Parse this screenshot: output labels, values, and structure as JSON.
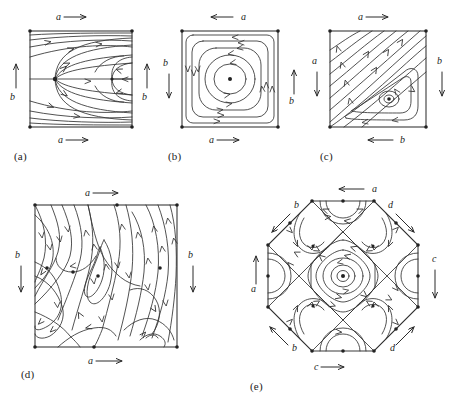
{
  "figure": {
    "background_color": "#ffffff",
    "stroke_color": "#2b2b2b",
    "panel_count": 5
  },
  "panels": [
    {
      "id": "a",
      "caption": "(a)",
      "shape": "square",
      "description": "Saddle-node on left edge midpoint with streamlines sweeping right to a saddle near the right edge",
      "edge_labels": [
        {
          "name": "a",
          "side": "top",
          "direction": "right",
          "glyph": "a"
        },
        {
          "name": "a",
          "side": "bottom",
          "direction": "right",
          "glyph": "a"
        },
        {
          "name": "b",
          "side": "left",
          "direction": "up",
          "glyph": "b"
        },
        {
          "name": "b",
          "side": "right",
          "direction": "up",
          "glyph": "b"
        }
      ],
      "singular_points": [
        "saddle-left-center",
        "saddle-right-center"
      ],
      "vertex_dots": 4
    },
    {
      "id": "b",
      "caption": "(b)",
      "shape": "square",
      "description": "Concentric closed orbits around a single center; nested rounded squares becoming circles",
      "edge_labels": [
        {
          "name": "a",
          "side": "top",
          "direction": "left",
          "glyph": "a"
        },
        {
          "name": "a",
          "side": "bottom",
          "direction": "right",
          "glyph": "a"
        },
        {
          "name": "b",
          "side": "left",
          "direction": "down",
          "glyph": "b"
        },
        {
          "name": "b",
          "side": "right",
          "direction": "up",
          "glyph": "b"
        }
      ],
      "singular_points": [
        "center"
      ],
      "vertex_dots": 4
    },
    {
      "id": "c",
      "caption": "(c)",
      "shape": "square",
      "description": "Parallel diagonal streamlines flowing up-right with a nested triangular spiral around a center in the lower right",
      "edge_labels": [
        {
          "name": "a",
          "side": "top",
          "direction": "right",
          "glyph": "a"
        },
        {
          "name": "a",
          "side": "left",
          "direction": "down",
          "glyph": "a"
        },
        {
          "name": "b",
          "side": "right",
          "direction": "down",
          "glyph": "b"
        },
        {
          "name": "b",
          "side": "bottom",
          "direction": "left",
          "glyph": "b"
        }
      ],
      "singular_points": [
        "center"
      ],
      "vertex_dots": 4
    },
    {
      "id": "d",
      "caption": "(d)",
      "shape": "square",
      "description": "Complex portrait with several centers and saddles distributed across the square",
      "edge_labels": [
        {
          "name": "a",
          "side": "top",
          "direction": "right",
          "glyph": "a"
        },
        {
          "name": "a",
          "side": "bottom",
          "direction": "right",
          "glyph": "a"
        },
        {
          "name": "b",
          "side": "left",
          "direction": "down",
          "glyph": "b"
        },
        {
          "name": "b",
          "side": "right",
          "direction": "down",
          "glyph": "b"
        }
      ],
      "singular_points": [
        "center-left",
        "center-middle",
        "center-lower-right",
        "saddle-top",
        "saddle-bottom",
        "saddle-mid-left"
      ],
      "vertex_dots": 4
    },
    {
      "id": "e",
      "caption": "(e)",
      "shape": "octagon",
      "description": "Octagon with a central rotated-square vortex, diagonal separatrices and eight peripheral cells",
      "edge_labels": [
        {
          "name": "a",
          "side": "top",
          "direction": "left",
          "glyph": "a"
        },
        {
          "name": "a",
          "side": "left",
          "direction": "up",
          "glyph": "a"
        },
        {
          "name": "b",
          "side": "upper-left-diagonal",
          "direction": "up-left",
          "glyph": "b"
        },
        {
          "name": "b",
          "side": "lower-left-diagonal",
          "direction": "up-left",
          "glyph": "b"
        },
        {
          "name": "c",
          "side": "right",
          "direction": "down",
          "glyph": "c"
        },
        {
          "name": "c",
          "side": "bottom",
          "direction": "right",
          "glyph": "c"
        },
        {
          "name": "d",
          "side": "upper-right-diagonal",
          "direction": "down-right",
          "glyph": "d"
        },
        {
          "name": "d",
          "side": "lower-right-diagonal",
          "direction": "down-right",
          "glyph": "d"
        }
      ],
      "singular_points": [
        "center",
        "saddle-nw",
        "saddle-ne",
        "saddle-sw",
        "saddle-se"
      ],
      "vertex_dots": 16
    }
  ]
}
